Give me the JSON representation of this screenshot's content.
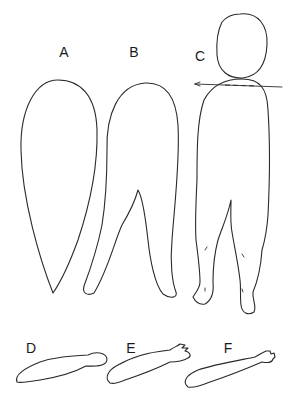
{
  "diagram": {
    "line_color": "#2a2a2a",
    "background": "#ffffff",
    "parts": [
      {
        "id": "A",
        "label": "A",
        "shape": "elongated teardrop outline"
      },
      {
        "id": "B",
        "label": "B",
        "shape": "split teardrop outline with leg notch"
      },
      {
        "id": "C",
        "label": "C",
        "shape": "full figure body with separate head, shoulder cut line and legs with feet"
      },
      {
        "id": "D",
        "label": "D",
        "shape": "arm outline with rounded end"
      },
      {
        "id": "E",
        "label": "E",
        "shape": "arm outline with forked hand"
      },
      {
        "id": "F",
        "label": "F",
        "shape": "arm outline with detailed hand"
      }
    ]
  }
}
